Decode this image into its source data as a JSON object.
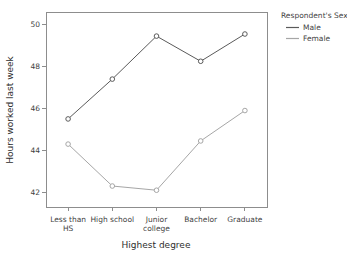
{
  "chart_data": {
    "type": "line",
    "title": "",
    "xlabel": "Highest degree",
    "ylabel": "Hours worked last week",
    "categories": [
      "Less than\nHS",
      "High school",
      "Junior\ncollege",
      "Bachelor",
      "Graduate"
    ],
    "category_labels": [
      {
        "line1": "Less than",
        "line2": "HS"
      },
      {
        "line1": "High school",
        "line2": ""
      },
      {
        "line1": "Junior",
        "line2": "college"
      },
      {
        "line1": "Bachelor",
        "line2": ""
      },
      {
        "line1": "Graduate",
        "line2": ""
      }
    ],
    "ylim": [
      41.3,
      50.6
    ],
    "yticks": [
      42,
      44,
      46,
      48,
      50
    ],
    "ytick_labels": [
      "42",
      "44",
      "46",
      "48",
      "50"
    ],
    "grid": false,
    "legend_position": "right",
    "series": [
      {
        "name": "Male",
        "color": "#5a5a5a",
        "values": [
          45.5,
          47.4,
          49.45,
          48.25,
          49.55
        ]
      },
      {
        "name": "Female",
        "color": "#a6a6a6",
        "values": [
          44.3,
          42.3,
          42.1,
          44.45,
          45.9
        ]
      }
    ]
  },
  "legend": {
    "title": "Respondent's Sex",
    "entries": [
      {
        "label": "Male",
        "color": "#5a5a5a"
      },
      {
        "label": "Female",
        "color": "#a6a6a6"
      }
    ]
  },
  "axes": {
    "x_title": "Highest degree",
    "y_title": "Hours worked last week"
  }
}
